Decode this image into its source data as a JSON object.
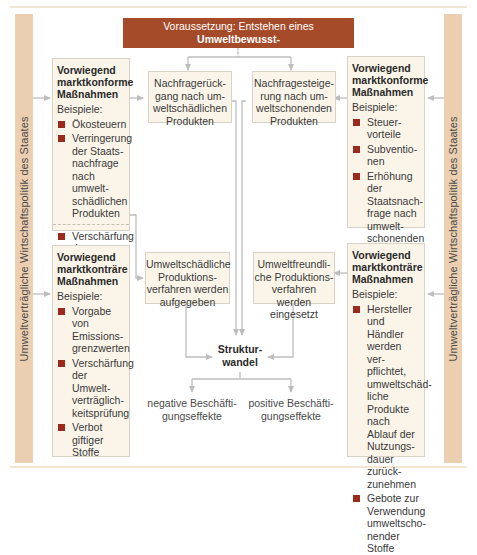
{
  "banner": {
    "text_pre": "Voraussetzung: Entstehen eines ",
    "text_bold1": "Umweltbewusst-",
    "text_bold2": "seins",
    "text_post": " in breiten Schichten der Bevölkerung"
  },
  "side_label": "Umweltverträgliche Wirtschaftspolitik des Staates",
  "left_top_box": {
    "title_lines": [
      "Vorwiegend",
      "marktkonforme",
      "Maßnahmen"
    ],
    "examples_label": "Beispiele:",
    "items": [
      "Ökosteuern",
      "Verringerung der Staats­nachfrage nach umwelt­schädlichen Produkten"
    ],
    "item_after_separator": "Verschärfung der Umwelt­haftung"
  },
  "left_bottom_box": {
    "title_lines": [
      "Vorwiegend",
      "marktkonträre",
      "Maßnahmen"
    ],
    "examples_label": "Beispiele:",
    "items": [
      "Vorgabe von Emissions­grenzwerten",
      "Verschärfung der Umwelt­verträglich­keitsprüfung",
      "Verbot giftiger Stoffe"
    ]
  },
  "right_top_box": {
    "title_lines": [
      "Vorwiegend",
      "marktkonforme",
      "Maßnahmen"
    ],
    "examples_label": "Beispiele:",
    "items": [
      "Steuer­vorteile",
      "Subventio­nen",
      "Erhöhung der Staatsnach­frage nach umwelt­schonenden Produkten"
    ]
  },
  "right_bottom_box": {
    "title_lines": [
      "Vorwiegend",
      "marktkonträre",
      "Maßnahmen"
    ],
    "examples_label": "Beispiele:",
    "items": [
      "Hersteller und Händler werden ver­pflichtet, umweltschäd­liche Produkte nach Ablauf der Nutzungs­dauer zurück­zunehmen",
      "Gebote zur Verwendung umweltscho­nender Stoffe"
    ]
  },
  "inner_boxes": {
    "demand_decline": "Nachfragerück­gang nach um­weltschädlichen Produkten",
    "demand_increase": "Nachfragesteige­rung nach um­weltschonenden Produkten",
    "harmful_production": "Umweltschädliche Produktions­verfahren werden aufgegeben",
    "friendly_production": "Umweltfreundli­che Produktions­verfahren werden eingesetzt"
  },
  "center": {
    "structural_change_line1": "Struktur-",
    "structural_change_line2": "wandel"
  },
  "effects": {
    "negative": "negative Beschäfti­gungseffekte",
    "positive": "positive Beschäfti­gungseffekte"
  },
  "colors": {
    "banner": "#a64b2a",
    "side_bar": "#ebcfb0",
    "box_fill": "#fbf5e9",
    "bullet": "#9b2a1e",
    "arrow": "#bdbdbd"
  }
}
